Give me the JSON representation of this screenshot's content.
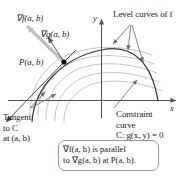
{
  "figure": {
    "type": "math-diagram",
    "topic": "Lagrange multipliers: constrained optimization",
    "axes": {
      "x_label": "x",
      "y_label": "y"
    },
    "labels": {
      "grad_f": "∇f(a, b)",
      "grad_g": "∇g(a, b)",
      "point": "P(a, b)",
      "level_curves": "Level curves of f",
      "constraint_line1": "Constraint",
      "constraint_line2": "curve",
      "constraint_line3": "C: g(x, y) = 0",
      "tangent_line1": "Tangent",
      "tangent_line2": "to C",
      "tangent_line3": "at (a, b)"
    },
    "caption": {
      "line1": "∇f(a, b) is parallel",
      "line2": "to ∇g(a, b) at P(a, b)."
    },
    "colors": {
      "axis": "#555555",
      "constraint_curve": "#3a3a3a",
      "level_curve": "#bdbdbd",
      "grad_f_arrow": "#bfbfbf",
      "grad_g_arrow": "#5a5a5a",
      "tangent_line": "#4a4a4a",
      "pointer": "#6e6e6e",
      "caption_border": "#9a9a9a",
      "text": "#1c1c1c",
      "background": "#ffffff"
    },
    "elements": {
      "point_marker": "filled-dot",
      "grad_f_arrow_name": "gradient-f-arrow",
      "grad_g_arrow_name": "gradient-g-arrow",
      "tangent_arrow_name": "tangent-line-arrow"
    }
  }
}
